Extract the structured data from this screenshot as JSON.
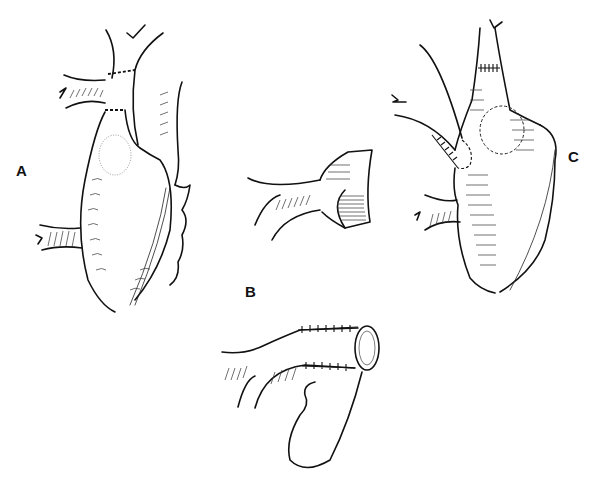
{
  "figure": {
    "type": "surgical illustration",
    "panels": [
      {
        "id": "A",
        "label": "A",
        "description": "Heart with great vessels; dashed lines on ascending vessel, stippled oval region"
      },
      {
        "id": "B",
        "label": "B",
        "description": "Vessel segment with branch, cut and flared end; below, vessel with sutured cuff and appendage flap"
      },
      {
        "id": "C",
        "label": "C",
        "description": "Heart after repair with sutured anastomoses on vessels and circular sutured patch"
      }
    ]
  }
}
